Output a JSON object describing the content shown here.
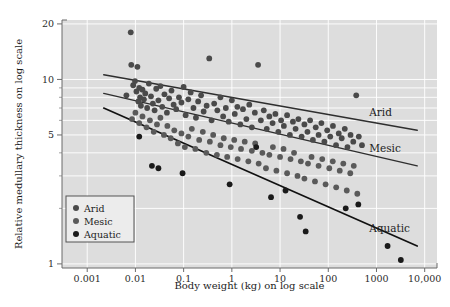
{
  "chart_data": {
    "type": "scatter",
    "title": "",
    "xlabel": "Body weight (kg) on log scale",
    "ylabel": "Relative medullary thickness on log scale",
    "xscale": "log",
    "yscale": "log",
    "xlim": [
      0.0003,
      18000
    ],
    "ylim": [
      0.95,
      21
    ],
    "grid": true,
    "grid_color": "#ffffff",
    "plot_background": "#dddddd",
    "legend_position": "lower-left-inside",
    "xticks": [
      "0.001",
      "0.01",
      "0.1",
      "1",
      "10",
      "100",
      "1000",
      "10,000"
    ],
    "xtick_values": [
      0.001,
      0.01,
      0.1,
      1,
      10,
      100,
      1000,
      10000
    ],
    "yticks": [
      "20",
      "10",
      "5",
      "1"
    ],
    "ytick_values": [
      20,
      10,
      5,
      1
    ],
    "series": [
      {
        "name": "Arid",
        "marker": "circle",
        "color": "#4a4a4a",
        "line_label": "Arid",
        "fit_line": {
          "x0": 0.0022,
          "y0": 10.6,
          "x1": 7000,
          "y1": 5.3,
          "color": "#2e2e2e",
          "width": 1.4
        },
        "points": [
          [
            0.0065,
            8.2
          ],
          [
            0.008,
            18.0
          ],
          [
            0.0082,
            12.0
          ],
          [
            0.009,
            9.3
          ],
          [
            0.0098,
            9.8
          ],
          [
            0.0105,
            8.6
          ],
          [
            0.011,
            11.7
          ],
          [
            0.0115,
            7.6
          ],
          [
            0.012,
            9.0
          ],
          [
            0.0125,
            8.0
          ],
          [
            0.013,
            7.2
          ],
          [
            0.014,
            8.8
          ],
          [
            0.015,
            7.8
          ],
          [
            0.016,
            8.4
          ],
          [
            0.0175,
            7.0
          ],
          [
            0.019,
            9.5
          ],
          [
            0.021,
            8.1
          ],
          [
            0.023,
            7.4
          ],
          [
            0.025,
            6.8
          ],
          [
            0.027,
            8.9
          ],
          [
            0.03,
            7.7
          ],
          [
            0.033,
            9.2
          ],
          [
            0.036,
            7.1
          ],
          [
            0.04,
            8.3
          ],
          [
            0.045,
            6.6
          ],
          [
            0.05,
            7.9
          ],
          [
            0.056,
            8.7
          ],
          [
            0.062,
            7.3
          ],
          [
            0.07,
            6.9
          ],
          [
            0.08,
            8.0
          ],
          [
            0.09,
            7.5
          ],
          [
            0.1,
            9.1
          ],
          [
            0.11,
            6.4
          ],
          [
            0.125,
            7.8
          ],
          [
            0.14,
            8.5
          ],
          [
            0.16,
            7.0
          ],
          [
            0.18,
            6.2
          ],
          [
            0.2,
            7.6
          ],
          [
            0.23,
            8.2
          ],
          [
            0.26,
            6.7
          ],
          [
            0.3,
            7.2
          ],
          [
            0.34,
            13.0
          ],
          [
            0.38,
            6.0
          ],
          [
            0.43,
            7.4
          ],
          [
            0.5,
            6.8
          ],
          [
            0.58,
            8.0
          ],
          [
            0.66,
            6.3
          ],
          [
            0.75,
            7.0
          ],
          [
            0.86,
            5.9
          ],
          [
            1.0,
            7.7
          ],
          [
            1.15,
            6.5
          ],
          [
            1.3,
            7.1
          ],
          [
            1.5,
            5.7
          ],
          [
            1.7,
            6.9
          ],
          [
            2.0,
            6.1
          ],
          [
            2.3,
            7.3
          ],
          [
            2.6,
            5.5
          ],
          [
            3.0,
            6.6
          ],
          [
            3.5,
            12.0
          ],
          [
            4.0,
            6.0
          ],
          [
            4.6,
            6.8
          ],
          [
            5.3,
            5.4
          ],
          [
            6.0,
            6.3
          ],
          [
            7.0,
            5.8
          ],
          [
            8.0,
            6.5
          ],
          [
            9.2,
            5.2
          ],
          [
            10.5,
            6.0
          ],
          [
            12.0,
            5.6
          ],
          [
            14.0,
            6.4
          ],
          [
            16.0,
            5.0
          ],
          [
            18.5,
            5.9
          ],
          [
            21.0,
            5.4
          ],
          [
            24.0,
            6.1
          ],
          [
            28.0,
            4.9
          ],
          [
            32.0,
            5.7
          ],
          [
            37.0,
            5.2
          ],
          [
            42.0,
            6.0
          ],
          [
            48.0,
            4.7
          ],
          [
            55.0,
            5.5
          ],
          [
            63.0,
            5.0
          ],
          [
            72.0,
            5.8
          ],
          [
            83.0,
            4.6
          ],
          [
            95.0,
            5.3
          ],
          [
            110.0,
            4.9
          ],
          [
            125.0,
            5.6
          ],
          [
            145.0,
            4.4
          ],
          [
            165.0,
            5.1
          ],
          [
            190.0,
            4.8
          ],
          [
            220.0,
            5.4
          ],
          [
            250.0,
            4.3
          ],
          [
            290.0,
            5.0
          ],
          [
            330.0,
            4.6
          ],
          [
            380.0,
            8.2
          ],
          [
            430.0,
            4.9
          ],
          [
            500.0,
            4.4
          ]
        ]
      },
      {
        "name": "Mesic",
        "marker": "circle",
        "color": "#5a5a5a",
        "line_label": "Mesic",
        "fit_line": {
          "x0": 0.0022,
          "y0": 8.4,
          "x1": 7000,
          "y1": 3.4,
          "color": "#2e2e2e",
          "width": 1.4
        },
        "points": [
          [
            0.0085,
            6.1
          ],
          [
            0.01,
            6.6
          ],
          [
            0.012,
            5.8
          ],
          [
            0.014,
            6.3
          ],
          [
            0.017,
            5.5
          ],
          [
            0.02,
            6.0
          ],
          [
            0.024,
            5.2
          ],
          [
            0.028,
            5.7
          ],
          [
            0.033,
            6.2
          ],
          [
            0.039,
            5.0
          ],
          [
            0.046,
            5.6
          ],
          [
            0.054,
            4.8
          ],
          [
            0.064,
            5.3
          ],
          [
            0.076,
            4.5
          ],
          [
            0.09,
            5.1
          ],
          [
            0.106,
            4.3
          ],
          [
            0.125,
            4.9
          ],
          [
            0.148,
            5.4
          ],
          [
            0.175,
            4.2
          ],
          [
            0.21,
            4.7
          ],
          [
            0.25,
            5.2
          ],
          [
            0.295,
            4.0
          ],
          [
            0.35,
            4.6
          ],
          [
            0.41,
            5.0
          ],
          [
            0.49,
            3.9
          ],
          [
            0.58,
            4.4
          ],
          [
            0.68,
            4.8
          ],
          [
            0.8,
            3.8
          ],
          [
            0.95,
            4.3
          ],
          [
            1.12,
            4.7
          ],
          [
            1.32,
            3.7
          ],
          [
            1.55,
            4.2
          ],
          [
            1.85,
            4.6
          ],
          [
            2.2,
            3.6
          ],
          [
            2.6,
            4.1
          ],
          [
            3.05,
            4.5
          ],
          [
            3.6,
            3.5
          ],
          [
            4.3,
            4.0
          ],
          [
            5.1,
            3.3
          ],
          [
            6.0,
            3.9
          ],
          [
            7.1,
            4.3
          ],
          [
            8.4,
            3.2
          ],
          [
            10.0,
            3.8
          ],
          [
            11.8,
            4.2
          ],
          [
            14.0,
            3.1
          ],
          [
            16.5,
            3.7
          ],
          [
            19.5,
            4.0
          ],
          [
            23.0,
            3.0
          ],
          [
            27.0,
            3.6
          ],
          [
            32.0,
            2.9
          ],
          [
            38.0,
            3.5
          ],
          [
            45.0,
            3.8
          ],
          [
            53.0,
            2.8
          ],
          [
            63.0,
            3.4
          ],
          [
            75.0,
            3.7
          ],
          [
            88.0,
            2.7
          ],
          [
            105.0,
            3.3
          ],
          [
            124.0,
            3.6
          ],
          [
            146.0,
            2.6
          ],
          [
            173.0,
            3.2
          ],
          [
            205.0,
            3.5
          ],
          [
            242.0,
            2.5
          ],
          [
            286.0,
            3.1
          ],
          [
            338.0,
            3.4
          ],
          [
            400.0,
            2.4
          ]
        ]
      },
      {
        "name": "Aquatic",
        "marker": "circle",
        "color": "#1a1a1a",
        "line_label": "Aquatic",
        "fit_line": {
          "x0": 0.0022,
          "y0": 7.0,
          "x1": 7000,
          "y1": 1.25,
          "color": "#111111",
          "width": 1.7
        },
        "points": [
          [
            0.012,
            4.9
          ],
          [
            0.022,
            3.4
          ],
          [
            0.03,
            3.3
          ],
          [
            0.095,
            3.1
          ],
          [
            0.9,
            2.7
          ],
          [
            3.2,
            4.3
          ],
          [
            6.5,
            2.3
          ],
          [
            13.0,
            2.5
          ],
          [
            26.0,
            1.8
          ],
          [
            34.0,
            1.5
          ],
          [
            230.0,
            2.0
          ],
          [
            420.0,
            2.1
          ],
          [
            1700.0,
            1.25
          ],
          [
            3200.0,
            1.05
          ]
        ]
      }
    ]
  },
  "legend": {
    "items": [
      {
        "label": "Arid",
        "color": "#4a4a4a"
      },
      {
        "label": "Mesic",
        "color": "#5a5a5a"
      },
      {
        "label": "Aquatic",
        "color": "#1a1a1a"
      }
    ]
  },
  "line_annotations": [
    {
      "label": "Arid"
    },
    {
      "label": "Mesic"
    },
    {
      "label": "Aquatic"
    }
  ]
}
